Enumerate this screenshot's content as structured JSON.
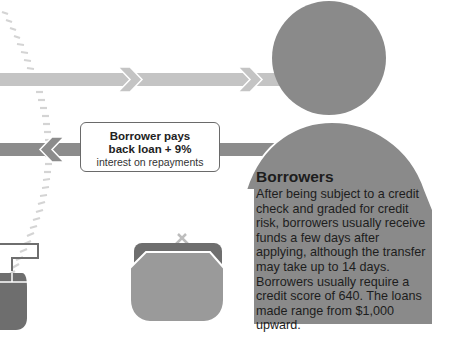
{
  "colors": {
    "background": "#ffffff",
    "person": "#8a8a8a",
    "arrow_light": "#c4c4c4",
    "arrow_dark": "#8c8c8c",
    "dash": "#d6d6d6",
    "purse_back": "#6e6e6e",
    "purse_front": "#9a9a9a",
    "mouse": "#6e6e6e",
    "box_border": "#6a6a6a"
  },
  "icons": {
    "person": "person-silhouette-icon",
    "purse": "coin-purse-icon",
    "mouse": "computer-mouse-icon",
    "arrow_right": "chevron-arrow-right-icon",
    "arrow_left": "chevron-arrow-left-icon"
  },
  "repayment_note": {
    "line1": "Borrower pays",
    "line2": "back loan + 9%",
    "line3": "interest on repayments"
  },
  "borrowers": {
    "title": "Borrowers",
    "body": "After being subject to a credit check and graded for credit risk, borrowers usually receive funds a few days after applying, although the transfer may take up to 14 days. Borrowers usually require a credit score of 640. The loans made range from $1,000 upward."
  }
}
